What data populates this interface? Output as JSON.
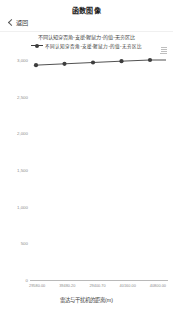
{
  "nav": {
    "back_label": "返回",
    "back_icon": "chevron-left-icon",
    "title": "函数图像"
  },
  "description": "不同认知穿否角-支援-猩鼠力-的值-无穷区比",
  "legend": [
    {
      "label": "不同认知穿否角-支援-猩鼠力-的值-无穷区比",
      "color": "#3d3d3d",
      "symbol": "line-with-circle-marker"
    }
  ],
  "export_icon": "download-chart-icon",
  "chart_data": {
    "type": "line",
    "title": "",
    "xlabel": "雷达与干扰机的距离(m)",
    "ylabel": "",
    "grid": false,
    "legend_position": "top-center",
    "series": [
      {
        "name": "不同认知穿否角-支援-猩鼠力-的值-无穷区比",
        "color": "#3d3d3d",
        "marker": "circle",
        "x": [
          29580.0,
          39480.2,
          29400.7,
          40160.0,
          40800.0
        ],
        "x_labels": [
          "29580.00",
          "39480.20",
          "29400.70",
          "40160.00",
          "40800.00"
        ],
        "values": [
          2930,
          2948,
          2966,
          2984,
          3000
        ]
      }
    ],
    "y_ticks": [
      3000,
      2500,
      2000,
      1500,
      1000,
      500,
      0
    ],
    "y_tick_labels": [
      "3,000",
      "2,500",
      "2,000",
      "1,500",
      "1,000",
      "500",
      "0"
    ],
    "ylim": [
      0,
      3100
    ],
    "x_tick_labels": [
      "29580.00",
      "39480.20",
      "29400.70",
      "40160.00",
      "40800.00"
    ]
  },
  "colors": {
    "line": "#3d3d3d",
    "marker": "#3d3d3d",
    "axis": "#b9b9b9",
    "tick_text": "#8d8d8d",
    "background": "#ffffff"
  }
}
